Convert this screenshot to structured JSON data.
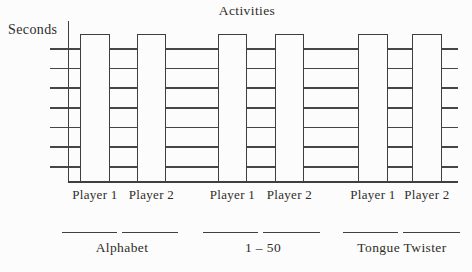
{
  "figure": {
    "title": "Activities",
    "y_axis_label": "Seconds"
  },
  "chart_data": {
    "type": "bar",
    "title": "Activities",
    "xlabel": "",
    "ylabel": "Seconds",
    "categories": [
      "Alphabet",
      "1 – 50",
      "Tongue Twister"
    ],
    "series": [
      {
        "name": "Player 1",
        "values": [
          1,
          1,
          1
        ]
      },
      {
        "name": "Player 2",
        "values": [
          1,
          1,
          1
        ]
      }
    ],
    "bar_labels": [
      "Player 1",
      "Player 2",
      "Player 1",
      "Player 2",
      "Player 1",
      "Player 2"
    ],
    "value_scale": "normalized; y-axis has no numeric tick labels — all 6 bars are drawn equal full height (blank worksheet template to be filled in)",
    "ylim": [
      0,
      1
    ],
    "y_gridline_count": 7,
    "grid": true,
    "legend_position": "none",
    "bar_fill": "#fcfcfc",
    "bar_outline": "#3f3f3f",
    "answer_blanks_per_group": 2
  },
  "colors": {
    "line": "#3f3f3f",
    "text": "#2f2d2a",
    "background": "#fcfcfc"
  }
}
